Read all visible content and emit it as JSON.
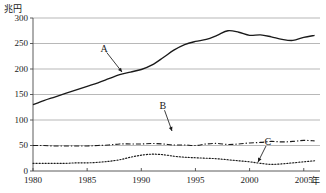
{
  "chart_data": {
    "type": "line",
    "title": "",
    "xlabel": "年",
    "ylabel": "兆円",
    "xlim": [
      1980,
      2006.5
    ],
    "ylim": [
      0,
      300
    ],
    "grid": true,
    "legend_position": "inline-annotations",
    "yticks": [
      0,
      50,
      100,
      150,
      200,
      250,
      300
    ],
    "ytick_labels": [
      "0",
      "50",
      "100",
      "150",
      "200",
      "250",
      "300"
    ],
    "xticks": [
      1980,
      1985,
      1990,
      1995,
      2000,
      2005
    ],
    "xtick_labels": [
      "1980",
      "1985",
      "1990",
      "1995",
      "2000",
      "2005"
    ],
    "x": [
      1980,
      1981,
      1982,
      1983,
      1984,
      1985,
      1986,
      1987,
      1988,
      1989,
      1990,
      1991,
      1992,
      1993,
      1994,
      1995,
      1996,
      1997,
      1998,
      1999,
      2000,
      2001,
      2002,
      2003,
      2004,
      2005,
      2006
    ],
    "series": [
      {
        "name": "A",
        "label": "A",
        "style": "solid",
        "color": "#1a1a1a",
        "annotation_x": 1991,
        "annotation_y": 200,
        "values": [
          130,
          138,
          145,
          152,
          159,
          166,
          173,
          181,
          189,
          194,
          199,
          208,
          222,
          237,
          248,
          254,
          258,
          266,
          275,
          272,
          266,
          267,
          263,
          258,
          256,
          262,
          266
        ]
      },
      {
        "name": "B",
        "label": "B",
        "style": "dash-dot",
        "color": "#1a1a1a",
        "annotation_x": 1994,
        "annotation_y": 49,
        "values": [
          50,
          50,
          49,
          49,
          49,
          49,
          50,
          51,
          53,
          53,
          53,
          54,
          53,
          51,
          51,
          50,
          53,
          54,
          52,
          53,
          55,
          56,
          58,
          57,
          58,
          60,
          59
        ]
      },
      {
        "name": "C",
        "label": "C",
        "style": "dotted",
        "color": "#1a1a1a",
        "annotation_x": 2002,
        "annotation_y": 13,
        "values": [
          15,
          15,
          15,
          15,
          16,
          16,
          17,
          19,
          22,
          27,
          31,
          33,
          32,
          29,
          27,
          26,
          25,
          24,
          22,
          20,
          18,
          15,
          13,
          14,
          16,
          18,
          20
        ]
      }
    ],
    "annotations": [
      {
        "label": "A",
        "label_x": 104,
        "label_y": 49,
        "tip_x": 122,
        "tip_y": 72
      },
      {
        "label": "B",
        "label_x": 163,
        "label_y": 106,
        "tip_x": 172,
        "tip_y": 131
      },
      {
        "label": "C",
        "label_x": 268,
        "label_y": 142,
        "tip_x": 258,
        "tip_y": 162
      }
    ]
  }
}
